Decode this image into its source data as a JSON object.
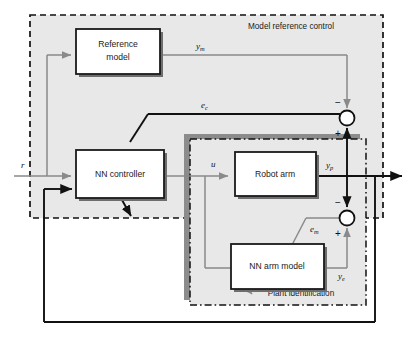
{
  "diagram": {
    "regions": [
      {
        "id": "model-reference-control",
        "label": "Model reference control",
        "border": "dashed",
        "color": "#111111"
      },
      {
        "id": "plant-identification",
        "label": "Plant identification",
        "border": "dash-dot",
        "color": "#111111",
        "shadow": "#8c8c8c"
      }
    ],
    "blocks": [
      {
        "id": "reference-model",
        "label": "Reference model",
        "line1": "Reference",
        "line2": "model"
      },
      {
        "id": "nn-controller",
        "label": "NN controller",
        "line1": "NN controller",
        "line2": ""
      },
      {
        "id": "robot-arm",
        "label": "Robot arm",
        "line1": "Robot arm",
        "line2": ""
      },
      {
        "id": "nn-arm-model",
        "label": "NN arm model",
        "line1": "NN arm model",
        "line2": ""
      }
    ],
    "signals": [
      {
        "id": "r",
        "base": "r",
        "sub": "",
        "desc": "reference input"
      },
      {
        "id": "ym",
        "base": "y",
        "sub": "m",
        "desc": "reference model output"
      },
      {
        "id": "ec",
        "base": "e",
        "sub": "c",
        "desc": "control error"
      },
      {
        "id": "u",
        "base": "u",
        "sub": "",
        "desc": "control signal"
      },
      {
        "id": "yp",
        "base": "y",
        "sub": "p",
        "desc": "plant output"
      },
      {
        "id": "em",
        "base": "e",
        "sub": "m",
        "desc": "model error"
      },
      {
        "id": "ye",
        "base": "y",
        "sub": "e",
        "desc": "estimated output"
      }
    ],
    "junctions": [
      {
        "id": "sum-control",
        "signs": {
          "top": "−",
          "bottom": "+"
        }
      },
      {
        "id": "sum-identification",
        "signs": {
          "top": "−",
          "bottom": "+"
        }
      }
    ],
    "colors": {
      "block_fill": "#ffffff",
      "block_stroke": "#1a1a1a",
      "block_shadow": "#6e6e6e",
      "region_fill": "#e8e8e8",
      "gray_signal": "#8a8a8a",
      "black_signal": "#111111",
      "page_bg": "#ffffff"
    }
  }
}
